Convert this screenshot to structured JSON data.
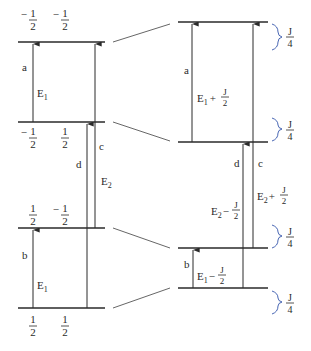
{
  "left_diagram": {
    "levels": [
      {
        "id": "top",
        "y": 42,
        "spins": [
          "-1/2",
          "-1/2"
        ]
      },
      {
        "id": "upper-mid",
        "y": 122,
        "spins": [
          "-1/2",
          "1/2"
        ]
      },
      {
        "id": "lower-mid",
        "y": 228,
        "spins": [
          "1/2",
          "-1/2"
        ]
      },
      {
        "id": "bottom",
        "y": 308,
        "spins": [
          "1/2",
          "1/2"
        ]
      }
    ],
    "transitions": [
      {
        "label": "a",
        "energy": "E1"
      },
      {
        "label": "b",
        "energy": "E1"
      },
      {
        "label": "c",
        "energy": "E2"
      },
      {
        "label": "d",
        "energy": ""
      }
    ],
    "spin_minus_num": "1",
    "spin_den": "2",
    "minus": "−",
    "label_a": "a",
    "label_b": "b",
    "label_c": "c",
    "label_d": "d",
    "energy_E": "E",
    "sub_1": "1",
    "sub_2": "2"
  },
  "right_diagram": {
    "levels": [
      {
        "id": "top",
        "y": 22
      },
      {
        "id": "upper-mid",
        "y": 142
      },
      {
        "id": "lower-mid",
        "y": 248
      },
      {
        "id": "bottom",
        "y": 288
      }
    ],
    "transitions": [
      {
        "label": "a",
        "energy": "E1 + J/2"
      },
      {
        "label": "b",
        "energy": "E1 − J/2"
      },
      {
        "label": "c",
        "energy": "E2 + J/2"
      },
      {
        "label": "d",
        "energy": "E2 − J/2"
      }
    ],
    "plus": "+",
    "minus": "−",
    "J": "J",
    "two": "2",
    "four": "4",
    "shift_labels": [
      "J/4",
      "J/4",
      "J/4",
      "J/4"
    ]
  },
  "colors": {
    "line": "#2a2a2a",
    "connector": "#555555"
  }
}
